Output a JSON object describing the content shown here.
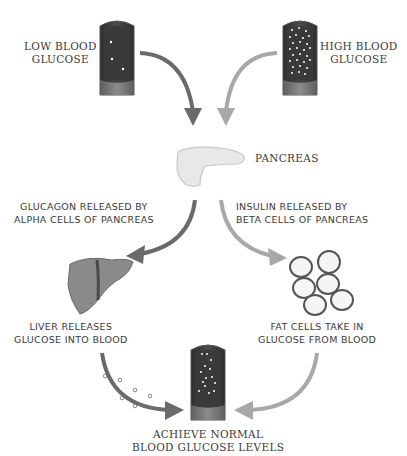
{
  "diagram": {
    "type": "blood glucose regulation cycle",
    "nodes": {
      "low_glucose": {
        "line1": "LOW BLOOD",
        "line2": "GLUCOSE"
      },
      "high_glucose": {
        "line1": "HIGH BLOOD",
        "line2": "GLUCOSE"
      },
      "pancreas": {
        "label": "PANCREAS"
      },
      "glucagon": {
        "line1": "GLUCAGON RELEASED BY",
        "line2": "ALPHA CELLS OF PANCREAS"
      },
      "insulin": {
        "line1": "INSULIN RELEASED BY",
        "line2": "BETA CELLS OF PANCREAS"
      },
      "liver": {
        "line1": "LIVER RELEASES",
        "line2": "GLUCOSE INTO BLOOD"
      },
      "fat_cells": {
        "line1": "FAT CELLS TAKE IN",
        "line2": "GLUCOSE FROM BLOOD"
      },
      "normal": {
        "line1": "ACHIEVE NORMAL",
        "line2": "BLOOD GLUCOSE LEVELS"
      }
    },
    "colors": {
      "dark_arrow": "#6a6a6a",
      "light_arrow": "#a8a8a8",
      "tube_dark": "#3c3c3c",
      "tube_base": "#7a7a7a",
      "liver": "#8a8a8a",
      "pancreas": "#e6e6e6"
    }
  }
}
